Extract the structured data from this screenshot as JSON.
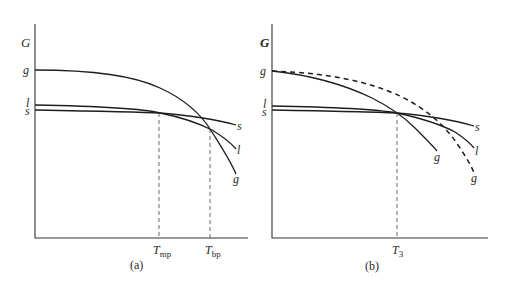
{
  "panels": [
    {
      "id": "a",
      "caption": "(a)",
      "y_axis_label": "G",
      "left_labels": {
        "g": "g",
        "l": "l",
        "s": "s"
      },
      "right_labels": {
        "s": "s",
        "l": "l",
        "g": "g"
      },
      "x_markers": [
        {
          "T": "T",
          "sub": "mp"
        },
        {
          "T": "T",
          "sub": "bp"
        }
      ]
    },
    {
      "id": "b",
      "caption": "(b)",
      "y_axis_label": "G",
      "left_labels": {
        "g": "g",
        "l": "l",
        "s": "s"
      },
      "right_labels": {
        "s": "s",
        "l": "l",
        "g_solid": "g",
        "g_dashed": "g"
      },
      "x_markers": [
        {
          "T": "T",
          "sub": "3"
        }
      ]
    }
  ],
  "colors": {
    "line": "#1e1e1e",
    "text": "#2a2a2a",
    "background": "#ffffff"
  }
}
